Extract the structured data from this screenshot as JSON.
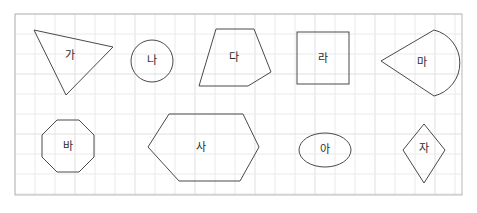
{
  "worksheet": {
    "title": "Geometric Shapes Grid",
    "canvas": {
      "width": 477,
      "height": 213,
      "background_color": "#ffffff"
    },
    "frame": {
      "x": 15,
      "y": 14,
      "width": 447,
      "height": 181,
      "stroke_color": "#b9b9b9",
      "fill_color": "#ffffff"
    },
    "grid": {
      "visible": true,
      "cell_size": 20,
      "minor_color": "#e9eaec",
      "major_color": "#dfe0e3"
    },
    "shape_style": {
      "stroke_color": "#4a4a4a",
      "stroke_width": 1,
      "fill": "none",
      "label_color": "#2b2b2b",
      "label_font_size": 11
    },
    "rows": [
      {
        "row_index": 1,
        "shapes": [
          {
            "label": "가",
            "kind": "triangle",
            "sides": 3,
            "points": "34,30 113,47 66,95",
            "label_x": 70,
            "label_y": 56
          },
          {
            "label": "나",
            "kind": "circle",
            "sides": 0,
            "cx": 152,
            "cy": 61,
            "r": 21,
            "label_x": 152,
            "label_y": 61
          },
          {
            "label": "다",
            "kind": "pentagon",
            "sides": 5,
            "points": "216,29 254,29 271,72 248,86 199,86",
            "label_x": 234,
            "label_y": 58
          },
          {
            "label": "라",
            "kind": "square",
            "sides": 4,
            "x": 297,
            "y": 32,
            "width": 52,
            "height": 52,
            "label_x": 323,
            "label_y": 59
          },
          {
            "label": "마",
            "kind": "sector",
            "sides": 0,
            "path": "M 381,61 L 434,30 A 34 34 0 0 1 434,96 Z",
            "label_x": 422,
            "label_y": 63
          }
        ]
      },
      {
        "row_index": 2,
        "shapes": [
          {
            "label": "바",
            "kind": "octagon",
            "sides": 8,
            "points": "57,120 79,120 94,135 94,157 79,172 57,172 42,157 42,135",
            "label_x": 68,
            "label_y": 147
          },
          {
            "label": "사",
            "kind": "hexagon",
            "sides": 6,
            "points": "169,114 243,114 259,147 240,181 179,181 148,147",
            "label_x": 201,
            "label_y": 148
          },
          {
            "label": "아",
            "kind": "ellipse",
            "sides": 0,
            "cx": 325,
            "cy": 150,
            "rx": 26,
            "ry": 17,
            "label_x": 325,
            "label_y": 150
          },
          {
            "label": "자",
            "kind": "rhombus",
            "sides": 4,
            "points": "424,124 445,150 424,183 403,150",
            "label_x": 424,
            "label_y": 149
          }
        ]
      }
    ]
  }
}
